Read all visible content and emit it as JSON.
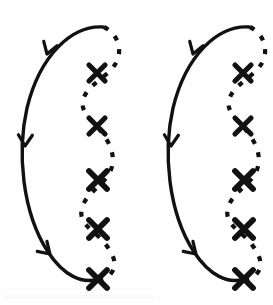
{
  "figure": {
    "width": 273,
    "height": 305,
    "background_color": "#fefefe",
    "ink_color": "#111111",
    "unit_count": 2,
    "unit_offset_x": 146,
    "solid_arc": {
      "stroke_color": "#111111",
      "stroke_width": 3.4,
      "style": "solid",
      "path": "M 103 27 C 72 25 40 55 27 108 C 17 152 22 212 48 252 C 64 276 82 284 98 279",
      "arrow_count": 3
    },
    "dashed_wave": {
      "stroke_color": "#111111",
      "stroke_width": 4.2,
      "style": "dashed",
      "dash_pattern": "5 9",
      "path": "M 104 27 C 118 34 123 50 116 63 C 108 77 90 83 84 97 C 78 111 92 120 99 129 C 110 142 117 157 110 172 C 103 186 86 193 82 208 C 78 222 91 229 99 237 C 110 248 119 262 112 272 C 108 279 102 281 97 279",
      "marker_count": 5
    },
    "arrowheads": [
      {
        "id": "arrow-top",
        "x": 47,
        "y": 54,
        "angle": 108,
        "size": 12
      },
      {
        "id": "arrow-middle",
        "x": 25,
        "y": 146,
        "angle": 92,
        "size": 12
      },
      {
        "id": "arrow-bottom",
        "x": 50,
        "y": 254,
        "angle": 44,
        "size": 12
      }
    ],
    "x_markers": [
      {
        "id": "x-marker-1",
        "label": "X",
        "x": 97,
        "y": 73,
        "size": 9
      },
      {
        "id": "x-marker-2",
        "label": "X",
        "x": 97,
        "y": 126,
        "size": 9
      },
      {
        "id": "x-marker-3",
        "label": "X",
        "x": 98,
        "y": 180,
        "size": 10
      },
      {
        "id": "x-marker-4",
        "label": "X",
        "x": 98,
        "y": 229,
        "size": 10
      },
      {
        "id": "x-marker-5",
        "label": "X",
        "x": 98,
        "y": 279,
        "size": 10
      }
    ]
  }
}
